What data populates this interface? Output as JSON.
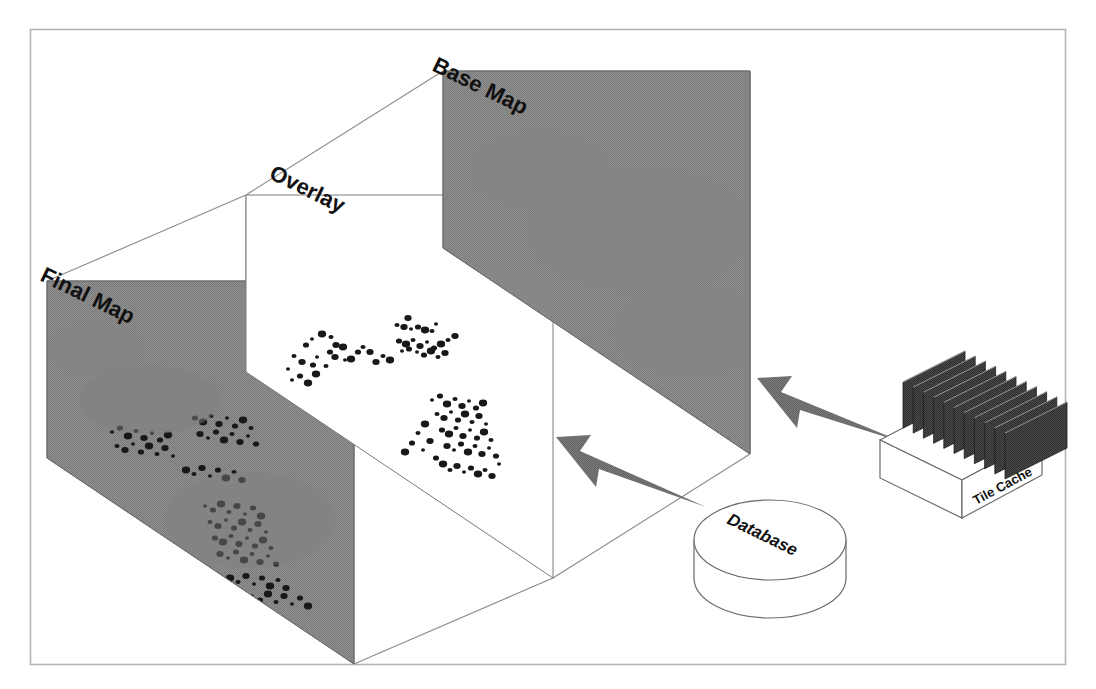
{
  "figure": {
    "kind": "isometric-layer-diagram",
    "background_color": "#ffffff",
    "frame": {
      "name": "figure-border",
      "color": "#b4b4b4",
      "x": 30,
      "y": 29,
      "width": 1036,
      "height": 636
    }
  },
  "palette": {
    "map_gray": "#8a8a8a",
    "map_gray_dark": "#7e7e7e",
    "line": "#7a7a7a",
    "line_dark": "#555555",
    "dot": "#181818",
    "arrow": "#6e6e6e",
    "tile_dark": "#3c3c3c",
    "white": "#ffffff",
    "text": "#111111"
  },
  "planes": [
    {
      "id": "base-map",
      "label": "Base Map",
      "fill": "gray",
      "has_dots": false,
      "label_rotation_deg": 26,
      "points": "443,71 750,71 750,454 443,248",
      "label_x": 431,
      "label_y": 70
    },
    {
      "id": "overlay",
      "label": "Overlay",
      "fill": "white",
      "has_dots": true,
      "label_rotation_deg": 26,
      "points": "246,195 553,195 553,578 246,372",
      "label_x": 268,
      "label_y": 178
    },
    {
      "id": "final-map",
      "label": "Final Map",
      "fill": "gray",
      "has_dots": true,
      "label_rotation_deg": 26,
      "points": "47,281 354,281 354,664 47,458",
      "label_x": 39,
      "label_y": 280
    }
  ],
  "connectors": [
    {
      "id": "top-back-left",
      "from": "base-map-top-left",
      "to": "overlay-top-left"
    },
    {
      "id": "top-front-left",
      "from": "overlay-top-left",
      "to": "final-map-top-left"
    },
    {
      "id": "bottom-right",
      "from": "base-map-bottom-right",
      "to": "final-map-bottom-right"
    },
    {
      "id": "overlay-vertical-left",
      "from": "overlay-top-left",
      "to": "overlay-bottom-left"
    }
  ],
  "arrows": [
    {
      "id": "tile-cache-to-base-map",
      "source": "tile-cache",
      "target": "base-map",
      "direction": "up-left",
      "tip": [
        757,
        378
      ],
      "tail": [
        905,
        443
      ]
    },
    {
      "id": "database-to-overlay",
      "source": "database",
      "target": "overlay",
      "direction": "up-left",
      "tip": [
        556,
        437
      ],
      "tail": [
        706,
        507
      ]
    }
  ],
  "nodes": {
    "database": {
      "id": "database",
      "label": "Database",
      "shape": "cylinder",
      "label_rotation_deg": 26,
      "center_x": 770,
      "center_y": 540,
      "rx": 76,
      "ry": 40,
      "body_height": 52,
      "fill": "#ffffff",
      "stroke": "#6b6b6b"
    },
    "tile_cache": {
      "id": "tile-cache",
      "label": "Tile Cache",
      "shape": "box-with-stacked-tiles",
      "label_rotation_deg": 26,
      "tile_count": 11,
      "fill": "#ffffff",
      "tile_fill": "#3c3c3c",
      "stroke": "#6b6b6b"
    }
  },
  "dot_clusters": {
    "overlay_upper": [
      [
        312,
        339
      ],
      [
        306,
        345
      ],
      [
        322,
        334
      ],
      [
        331,
        337
      ],
      [
        336,
        345
      ],
      [
        317,
        357
      ],
      [
        330,
        352
      ],
      [
        343,
        347
      ],
      [
        294,
        356
      ],
      [
        302,
        362
      ],
      [
        288,
        369
      ],
      [
        313,
        365
      ],
      [
        316,
        374
      ],
      [
        326,
        366
      ],
      [
        335,
        357
      ],
      [
        345,
        360
      ],
      [
        358,
        352
      ],
      [
        351,
        359
      ],
      [
        363,
        347
      ],
      [
        370,
        352
      ],
      [
        292,
        380
      ],
      [
        300,
        376
      ],
      [
        308,
        383
      ],
      [
        397,
        325
      ],
      [
        404,
        327
      ],
      [
        411,
        329
      ],
      [
        418,
        327
      ],
      [
        425,
        330
      ],
      [
        432,
        331
      ],
      [
        408,
        318
      ],
      [
        436,
        324
      ],
      [
        399,
        341
      ],
      [
        406,
        344
      ],
      [
        413,
        340
      ],
      [
        420,
        346
      ],
      [
        427,
        342
      ],
      [
        434,
        348
      ],
      [
        441,
        344
      ],
      [
        448,
        340
      ],
      [
        455,
        336
      ],
      [
        417,
        352
      ],
      [
        424,
        355
      ],
      [
        431,
        351
      ],
      [
        438,
        357
      ],
      [
        445,
        353
      ],
      [
        402,
        351
      ],
      [
        409,
        349
      ],
      [
        390,
        360
      ],
      [
        383,
        356
      ],
      [
        376,
        362
      ]
    ],
    "overlay_lower": [
      [
        432,
        400
      ],
      [
        440,
        396
      ],
      [
        447,
        404
      ],
      [
        455,
        399
      ],
      [
        462,
        406
      ],
      [
        469,
        401
      ],
      [
        476,
        408
      ],
      [
        483,
        403
      ],
      [
        437,
        414
      ],
      [
        444,
        418
      ],
      [
        451,
        412
      ],
      [
        458,
        420
      ],
      [
        465,
        414
      ],
      [
        472,
        422
      ],
      [
        479,
        416
      ],
      [
        486,
        424
      ],
      [
        442,
        430
      ],
      [
        449,
        434
      ],
      [
        456,
        428
      ],
      [
        463,
        436
      ],
      [
        470,
        430
      ],
      [
        477,
        438
      ],
      [
        484,
        432
      ],
      [
        491,
        440
      ],
      [
        447,
        446
      ],
      [
        454,
        450
      ],
      [
        461,
        444
      ],
      [
        468,
        452
      ],
      [
        475,
        446
      ],
      [
        482,
        454
      ],
      [
        489,
        448
      ],
      [
        496,
        456
      ],
      [
        425,
        424
      ],
      [
        418,
        433
      ],
      [
        430,
        441
      ],
      [
        423,
        450
      ],
      [
        436,
        458
      ],
      [
        443,
        464
      ],
      [
        450,
        470
      ],
      [
        457,
        466
      ],
      [
        464,
        472
      ],
      [
        471,
        468
      ],
      [
        478,
        474
      ],
      [
        485,
        470
      ],
      [
        492,
        476
      ],
      [
        499,
        464
      ],
      [
        412,
        443
      ],
      [
        405,
        452
      ]
    ],
    "final_map_dots": [
      [
        112,
        432
      ],
      [
        120,
        428
      ],
      [
        128,
        436
      ],
      [
        136,
        431
      ],
      [
        144,
        438
      ],
      [
        152,
        433
      ],
      [
        160,
        440
      ],
      [
        168,
        435
      ],
      [
        117,
        446
      ],
      [
        125,
        450
      ],
      [
        133,
        444
      ],
      [
        141,
        452
      ],
      [
        149,
        446
      ],
      [
        157,
        454
      ],
      [
        165,
        448
      ],
      [
        173,
        456
      ],
      [
        195,
        418
      ],
      [
        203,
        422
      ],
      [
        211,
        416
      ],
      [
        219,
        424
      ],
      [
        227,
        418
      ],
      [
        235,
        426
      ],
      [
        243,
        420
      ],
      [
        251,
        428
      ],
      [
        200,
        434
      ],
      [
        208,
        438
      ],
      [
        216,
        432
      ],
      [
        224,
        440
      ],
      [
        232,
        434
      ],
      [
        240,
        442
      ],
      [
        248,
        436
      ],
      [
        256,
        444
      ],
      [
        186,
        470
      ],
      [
        194,
        474
      ],
      [
        202,
        468
      ],
      [
        210,
        476
      ],
      [
        218,
        470
      ],
      [
        226,
        478
      ],
      [
        234,
        472
      ],
      [
        242,
        480
      ],
      [
        205,
        506
      ],
      [
        213,
        510
      ],
      [
        221,
        504
      ],
      [
        229,
        512
      ],
      [
        237,
        506
      ],
      [
        245,
        514
      ],
      [
        253,
        508
      ],
      [
        261,
        516
      ],
      [
        210,
        522
      ],
      [
        218,
        526
      ],
      [
        226,
        520
      ],
      [
        234,
        528
      ],
      [
        242,
        522
      ],
      [
        250,
        530
      ],
      [
        258,
        524
      ],
      [
        266,
        532
      ],
      [
        215,
        538
      ],
      [
        223,
        542
      ],
      [
        231,
        536
      ],
      [
        239,
        544
      ],
      [
        247,
        538
      ],
      [
        255,
        546
      ],
      [
        263,
        540
      ],
      [
        271,
        548
      ],
      [
        220,
        554
      ],
      [
        228,
        558
      ],
      [
        236,
        552
      ],
      [
        244,
        560
      ],
      [
        252,
        554
      ],
      [
        260,
        562
      ],
      [
        268,
        556
      ],
      [
        276,
        564
      ],
      [
        230,
        578
      ],
      [
        238,
        582
      ],
      [
        246,
        576
      ],
      [
        254,
        584
      ],
      [
        262,
        578
      ],
      [
        270,
        586
      ],
      [
        278,
        580
      ],
      [
        286,
        588
      ],
      [
        252,
        596
      ],
      [
        260,
        600
      ],
      [
        268,
        594
      ],
      [
        276,
        602
      ],
      [
        284,
        596
      ],
      [
        292,
        604
      ],
      [
        300,
        598
      ],
      [
        308,
        606
      ]
    ]
  }
}
